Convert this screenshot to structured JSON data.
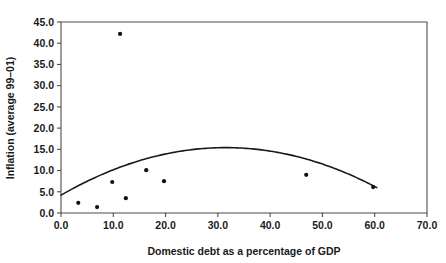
{
  "chart_data": {
    "type": "scatter",
    "title": "",
    "xlabel": "Domestic debt as a percentage of GDP",
    "ylabel": "Inflation (average 99–01)",
    "xlim": [
      0.0,
      70.0
    ],
    "ylim": [
      0.0,
      45.0
    ],
    "xticks": [
      "0.0",
      "10.0",
      "20.0",
      "30.0",
      "40.0",
      "50.0",
      "60.0",
      "70.0"
    ],
    "xtick_values": [
      0,
      10,
      20,
      30,
      40,
      50,
      60,
      70
    ],
    "yticks": [
      "0.0",
      "5.0",
      "10.0",
      "15.0",
      "20.0",
      "25.0",
      "30.0",
      "35.0",
      "40.0",
      "45.0"
    ],
    "ytick_values": [
      0,
      5,
      10,
      15,
      20,
      25,
      30,
      35,
      40,
      45
    ],
    "grid": false,
    "legend": null,
    "marker_color": "#111111",
    "curve_color": "#1a1a1a",
    "frame_color": "#4d4d4d",
    "points": [
      {
        "x": 3.3,
        "y": 2.4
      },
      {
        "x": 6.9,
        "y": 1.4
      },
      {
        "x": 9.8,
        "y": 7.3
      },
      {
        "x": 11.3,
        "y": 42.2
      },
      {
        "x": 12.4,
        "y": 3.5
      },
      {
        "x": 16.3,
        "y": 10.1
      },
      {
        "x": 19.7,
        "y": 7.5
      },
      {
        "x": 46.9,
        "y": 9.0
      },
      {
        "x": 59.7,
        "y": 6.1
      }
    ],
    "series": [
      {
        "name": "observations",
        "x": [
          3.3,
          6.9,
          9.8,
          11.3,
          12.4,
          16.3,
          19.7,
          46.9,
          59.7
        ],
        "values": [
          2.4,
          1.4,
          7.3,
          42.2,
          3.5,
          10.1,
          7.5,
          9.0,
          6.1
        ]
      }
    ],
    "fit_curve": {
      "name": "quadratic fit",
      "type": "quadratic",
      "x_start": 0.0,
      "x_end": 60.4,
      "y_start": 4.2,
      "y_end": 4.5,
      "vertex_x": 31.5,
      "vertex_y": 15.4
    }
  }
}
